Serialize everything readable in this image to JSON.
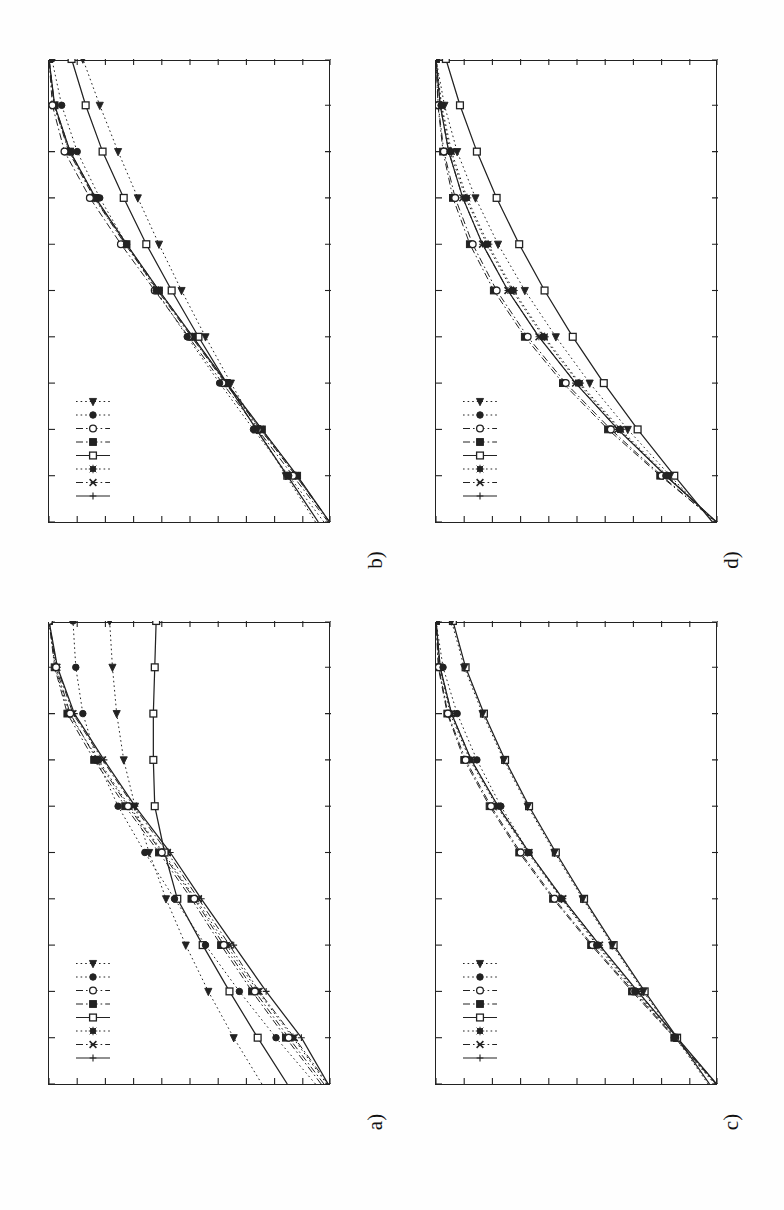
{
  "figure": {
    "background": "#ffffff",
    "ink": "#222222",
    "orientation": "rotated-90-ccw",
    "panel_count": 4,
    "panel_labels": [
      "a)",
      "b)",
      "c)",
      "d)"
    ]
  },
  "panels": [
    {
      "key": "a",
      "label": "a)",
      "label_name": "panel-label-a"
    },
    {
      "key": "b",
      "label": "b)",
      "label_name": "panel-label-b"
    },
    {
      "key": "c",
      "label": "c)",
      "label_name": "panel-label-c"
    },
    {
      "key": "d",
      "label": "d)",
      "label_name": "panel-label-d"
    }
  ],
  "legend": {
    "entries": [
      {
        "marker": "plus",
        "line": "solid",
        "name": "legend-entry-plus"
      },
      {
        "marker": "cross",
        "line": "dashdot",
        "name": "legend-entry-cross"
      },
      {
        "marker": "asterisk",
        "line": "dotted",
        "name": "legend-entry-asterisk"
      },
      {
        "marker": "open-square",
        "line": "solid",
        "name": "legend-entry-open-square"
      },
      {
        "marker": "filled-square",
        "line": "dashdot",
        "name": "legend-entry-filled-square"
      },
      {
        "marker": "open-circle",
        "line": "dashdot",
        "name": "legend-entry-open-circle"
      },
      {
        "marker": "filled-circle",
        "line": "dotted",
        "name": "legend-entry-filled-circle"
      },
      {
        "marker": "left-triangle",
        "line": "dotted",
        "name": "legend-entry-left-triangle"
      }
    ],
    "position": "upper-left"
  },
  "chart_data": [
    {
      "type": "line",
      "panel": "a)",
      "title": "",
      "xlabel": "",
      "ylabel": "",
      "grid": false,
      "legend_position": "upper-left",
      "xlim": [
        0,
        10
      ],
      "ylim": [
        0,
        10
      ],
      "xticks": [
        0,
        1,
        2,
        3,
        4,
        5,
        6,
        7,
        8,
        9,
        10
      ],
      "yticks": [
        0,
        1,
        2,
        3,
        4,
        5,
        6,
        7,
        8,
        9,
        10
      ],
      "x": [
        0,
        1,
        2,
        3,
        4,
        5,
        6,
        7,
        8,
        9,
        10
      ],
      "series": [
        {
          "name": "plus",
          "marker": "plus",
          "line": "solid",
          "values": [
            0.1,
            1.05,
            2.3,
            3.45,
            4.6,
            5.7,
            6.95,
            8.05,
            9.1,
            9.7,
            10.0
          ]
        },
        {
          "name": "cross",
          "marker": "cross",
          "line": "dashdot",
          "values": [
            0.1,
            1.3,
            2.55,
            3.6,
            4.7,
            5.8,
            7.0,
            8.1,
            9.15,
            9.72,
            10.0
          ]
        },
        {
          "name": "asterisk",
          "marker": "asterisk",
          "line": "dotted",
          "values": [
            0.15,
            1.35,
            2.6,
            3.7,
            4.8,
            5.95,
            7.15,
            8.25,
            9.3,
            9.78,
            10.0
          ]
        },
        {
          "name": "open-square",
          "marker": "open-square",
          "line": "solid",
          "values": [
            1.55,
            2.6,
            3.6,
            4.55,
            5.45,
            5.9,
            6.25,
            6.3,
            6.3,
            6.25,
            6.2
          ]
        },
        {
          "name": "filled-square",
          "marker": "filled-square",
          "line": "dashdot",
          "values": [
            0.35,
            1.6,
            2.8,
            3.9,
            4.95,
            6.1,
            7.3,
            8.4,
            9.35,
            9.8,
            10.0
          ]
        },
        {
          "name": "open-circle",
          "marker": "open-circle",
          "line": "dashdot",
          "values": [
            0.25,
            1.5,
            2.7,
            3.8,
            4.85,
            6.0,
            7.2,
            8.3,
            9.25,
            9.75,
            10.0
          ]
        },
        {
          "name": "filled-circle",
          "marker": "filled-circle",
          "line": "dotted",
          "values": [
            0.55,
            1.95,
            3.25,
            4.45,
            5.55,
            6.6,
            7.55,
            8.3,
            8.8,
            9.05,
            9.15
          ]
        },
        {
          "name": "left-triangle",
          "marker": "left-triangle",
          "line": "dotted",
          "values": [
            2.45,
            3.45,
            4.35,
            5.15,
            5.85,
            6.45,
            6.95,
            7.35,
            7.6,
            7.75,
            7.85
          ]
        }
      ]
    },
    {
      "type": "line",
      "panel": "b)",
      "title": "",
      "xlabel": "",
      "ylabel": "",
      "grid": false,
      "legend_position": "upper-left",
      "xlim": [
        0,
        10
      ],
      "ylim": [
        0,
        10
      ],
      "xticks": [
        0,
        1,
        2,
        3,
        4,
        5,
        6,
        7,
        8,
        9,
        10
      ],
      "yticks": [
        0,
        1,
        2,
        3,
        4,
        5,
        6,
        7,
        8,
        9,
        10
      ],
      "x": [
        0,
        1,
        2,
        3,
        4,
        5,
        6,
        7,
        8,
        9,
        10
      ],
      "series": [
        {
          "name": "plus",
          "marker": "plus",
          "line": "solid",
          "values": [
            0.05,
            1.2,
            2.45,
            3.7,
            4.9,
            6.1,
            7.25,
            8.35,
            9.25,
            9.8,
            10.0
          ]
        },
        {
          "name": "cross",
          "marker": "cross",
          "line": "dashdot",
          "values": [
            0.05,
            1.25,
            2.5,
            3.75,
            4.95,
            6.15,
            7.3,
            8.4,
            9.3,
            9.82,
            10.0
          ]
        },
        {
          "name": "asterisk",
          "marker": "asterisk",
          "line": "dotted",
          "values": [
            0.05,
            1.25,
            2.5,
            3.72,
            4.92,
            6.12,
            7.28,
            8.38,
            9.28,
            9.82,
            10.0
          ]
        },
        {
          "name": "open-square",
          "marker": "open-square",
          "line": "solid",
          "values": [
            0.45,
            1.55,
            2.65,
            3.7,
            4.7,
            5.65,
            6.55,
            7.35,
            8.1,
            8.7,
            9.2
          ]
        },
        {
          "name": "filled-square",
          "marker": "filled-square",
          "line": "dashdot",
          "values": [
            0.05,
            1.2,
            2.45,
            3.7,
            4.9,
            6.1,
            7.25,
            8.35,
            9.25,
            9.8,
            10.0
          ]
        },
        {
          "name": "open-circle",
          "marker": "open-circle",
          "line": "dashdot",
          "values": [
            0.1,
            1.35,
            2.6,
            3.85,
            5.05,
            6.25,
            7.45,
            8.55,
            9.45,
            9.88,
            10.0
          ]
        },
        {
          "name": "filled-circle",
          "marker": "filled-circle",
          "line": "dotted",
          "values": [
            0.25,
            1.5,
            2.75,
            3.95,
            5.1,
            6.2,
            7.25,
            8.2,
            9.0,
            9.55,
            9.9
          ]
        },
        {
          "name": "left-triangle",
          "marker": "left-triangle",
          "line": "dotted",
          "values": [
            0.55,
            1.6,
            2.6,
            3.55,
            4.45,
            5.3,
            6.1,
            6.85,
            7.55,
            8.2,
            8.8
          ]
        }
      ]
    },
    {
      "type": "line",
      "panel": "c)",
      "title": "",
      "xlabel": "",
      "ylabel": "",
      "grid": false,
      "legend_position": "upper-left",
      "xlim": [
        0,
        10
      ],
      "ylim": [
        0,
        10
      ],
      "xticks": [
        0,
        1,
        2,
        3,
        4,
        5,
        6,
        7,
        8,
        9,
        10
      ],
      "yticks": [
        0,
        1,
        2,
        3,
        4,
        5,
        6,
        7,
        8,
        9,
        10
      ],
      "x": [
        0,
        1,
        2,
        3,
        4,
        5,
        6,
        7,
        8,
        9,
        10
      ],
      "series": [
        {
          "name": "plus",
          "marker": "plus",
          "line": "solid",
          "values": [
            0.05,
            1.45,
            2.85,
            4.2,
            5.5,
            6.7,
            7.8,
            8.75,
            9.45,
            9.85,
            10.0
          ]
        },
        {
          "name": "cross",
          "marker": "cross",
          "line": "dashdot",
          "values": [
            0.05,
            1.45,
            2.85,
            4.2,
            5.5,
            6.7,
            7.8,
            8.75,
            9.45,
            9.85,
            10.0
          ]
        },
        {
          "name": "asterisk",
          "marker": "asterisk",
          "line": "dotted",
          "values": [
            0.08,
            1.5,
            2.9,
            4.25,
            5.55,
            6.75,
            7.85,
            8.8,
            9.5,
            9.88,
            10.0
          ]
        },
        {
          "name": "open-square",
          "marker": "open-square",
          "line": "solid",
          "values": [
            0.3,
            1.45,
            2.6,
            3.7,
            4.75,
            5.75,
            6.7,
            7.55,
            8.3,
            8.95,
            9.4
          ]
        },
        {
          "name": "filled-square",
          "marker": "filled-square",
          "line": "dashdot",
          "values": [
            0.05,
            1.55,
            3.05,
            4.5,
            5.85,
            7.05,
            8.1,
            9.0,
            9.6,
            9.92,
            10.0
          ]
        },
        {
          "name": "open-circle",
          "marker": "open-circle",
          "line": "dashdot",
          "values": [
            0.07,
            1.52,
            3.0,
            4.45,
            5.8,
            7.0,
            8.05,
            8.95,
            9.58,
            9.9,
            10.0
          ]
        },
        {
          "name": "filled-circle",
          "marker": "filled-circle",
          "line": "dotted",
          "values": [
            0.12,
            1.55,
            2.95,
            4.3,
            5.55,
            6.7,
            7.7,
            8.55,
            9.25,
            9.75,
            10.0
          ]
        },
        {
          "name": "left-triangle",
          "marker": "left-triangle",
          "line": "dotted",
          "values": [
            0.35,
            1.5,
            2.65,
            3.75,
            4.8,
            5.8,
            6.75,
            7.6,
            8.35,
            9.0,
            9.45
          ]
        }
      ]
    },
    {
      "type": "line",
      "panel": "d)",
      "title": "",
      "xlabel": "",
      "ylabel": "",
      "grid": false,
      "legend_position": "upper-left",
      "xlim": [
        0,
        10
      ],
      "ylim": [
        0,
        10
      ],
      "xticks": [
        0,
        1,
        2,
        3,
        4,
        5,
        6,
        7,
        8,
        9,
        10
      ],
      "yticks": [
        0,
        1,
        2,
        3,
        4,
        5,
        6,
        7,
        8,
        9,
        10
      ],
      "x": [
        0,
        1,
        2,
        3,
        4,
        5,
        6,
        7,
        8,
        9,
        10
      ],
      "series": [
        {
          "name": "plus",
          "marker": "plus",
          "line": "solid",
          "values": [
            0.05,
            1.85,
            3.55,
            5.05,
            6.35,
            7.45,
            8.35,
            9.05,
            9.55,
            9.85,
            10.0
          ]
        },
        {
          "name": "cross",
          "marker": "cross",
          "line": "dashdot",
          "values": [
            0.05,
            1.85,
            3.55,
            5.05,
            6.35,
            7.45,
            8.35,
            9.05,
            9.55,
            9.85,
            10.0
          ]
        },
        {
          "name": "asterisk",
          "marker": "asterisk",
          "line": "dotted",
          "values": [
            0.06,
            1.8,
            3.45,
            4.9,
            6.15,
            7.25,
            8.15,
            8.9,
            9.45,
            9.8,
            10.0
          ]
        },
        {
          "name": "open-square",
          "marker": "open-square",
          "line": "solid",
          "values": [
            0.2,
            1.55,
            2.85,
            4.05,
            5.15,
            6.15,
            7.05,
            7.85,
            8.55,
            9.15,
            9.65
          ]
        },
        {
          "name": "filled-square",
          "marker": "filled-square",
          "line": "dashdot",
          "values": [
            0.05,
            2.05,
            3.9,
            5.5,
            6.85,
            7.95,
            8.8,
            9.4,
            9.75,
            9.93,
            10.0
          ]
        },
        {
          "name": "open-circle",
          "marker": "open-circle",
          "line": "dashdot",
          "values": [
            0.07,
            2.0,
            3.8,
            5.4,
            6.75,
            7.85,
            8.7,
            9.32,
            9.72,
            9.92,
            10.0
          ]
        },
        {
          "name": "filled-circle",
          "marker": "filled-circle",
          "line": "dotted",
          "values": [
            0.1,
            1.85,
            3.5,
            4.95,
            6.2,
            7.3,
            8.2,
            8.95,
            9.5,
            9.82,
            10.0
          ]
        },
        {
          "name": "left-triangle",
          "marker": "left-triangle",
          "line": "dotted",
          "values": [
            0.15,
            1.7,
            3.2,
            4.55,
            5.75,
            6.85,
            7.8,
            8.6,
            9.25,
            9.7,
            10.0
          ]
        }
      ]
    }
  ]
}
